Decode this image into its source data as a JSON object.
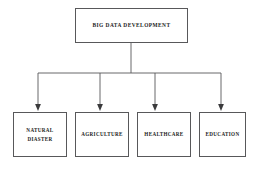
{
  "diagram": {
    "title": "BIG DATA DEVELOPMENT",
    "type": "hierarchy-tree",
    "orientation": "top-down",
    "background_color": "#ffffff",
    "line_color": "#58585a",
    "text_color": "#1b1b1b",
    "root": {
      "label": "BIG DATA DEVELOPMENT"
    },
    "children": [
      {
        "label": "NATURAL\nDIASTER"
      },
      {
        "label": "AGRICULTURE"
      },
      {
        "label": "HEALTHCARE"
      },
      {
        "label": "EDUCATION"
      }
    ],
    "connector": {
      "style": "orthogonal-bus-with-arrowheads",
      "arrowhead": "solid-triangle",
      "stem_x": 131,
      "bus_y": 73,
      "bus_start_x": 38,
      "bus_end_x": 221,
      "arrow_x_positions": [
        38,
        100,
        155,
        221
      ]
    }
  }
}
